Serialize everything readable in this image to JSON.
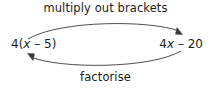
{
  "diagram": {
    "title": "",
    "background_color": "#ffffff",
    "stroke_color": "#3a3a3a",
    "text_color": "#1c1c1c",
    "top_label": "multiply out brackets",
    "bottom_label": "factorise",
    "left_expression": {
      "full": "4(x – 5)",
      "prefix": "4(",
      "variable": "x",
      "suffix": " – 5)"
    },
    "right_expression": {
      "full": "4x – 20",
      "prefix": "4",
      "variable": "x",
      "suffix": " – 20"
    },
    "arrows": [
      {
        "name": "top-arrow",
        "direction": "left-to-right",
        "label": "multiply out brackets"
      },
      {
        "name": "bottom-arrow",
        "direction": "right-to-left",
        "label": "factorise"
      }
    ]
  }
}
